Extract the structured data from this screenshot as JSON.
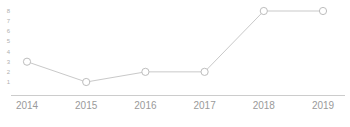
{
  "chart_data": {
    "type": "line",
    "title": "",
    "subtitle": "",
    "xlabel": "",
    "ylabel": "",
    "categories": [
      "2014",
      "2015",
      "2016",
      "2017",
      "2018",
      "2019"
    ],
    "values": [
      3,
      1,
      2,
      2,
      8,
      8
    ],
    "series": [
      {
        "name": "",
        "values": [
          3,
          1,
          2,
          2,
          8,
          8
        ]
      }
    ],
    "y_ticks": [
      8,
      7,
      6,
      5,
      4,
      3,
      2,
      1
    ],
    "ylim": [
      0,
      8
    ],
    "xlim": [
      0,
      5
    ],
    "grid": false,
    "legend": false,
    "legend_position": "none",
    "annotations": [],
    "marker": "circle-open",
    "colors": {
      "line": "#c9c9c9",
      "marker_stroke": "#bdbdbd",
      "marker_fill": "#ffffff",
      "axis": "#cccccc",
      "x_tick_text": "#9a9a9a",
      "y_tick_text": "#b0b0b0",
      "background": "#ffffff"
    }
  },
  "axis": {
    "x_axis_line": "x-axis-rule"
  }
}
